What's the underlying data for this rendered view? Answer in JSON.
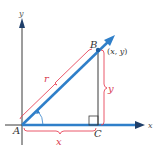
{
  "diagram": {
    "type": "vector-right-triangle",
    "axes": {
      "x_label": "x",
      "y_label": "y"
    },
    "points": {
      "A": {
        "label": "A"
      },
      "B": {
        "label": "B",
        "coords_label": "(x, y)"
      },
      "C": {
        "label": "C"
      }
    },
    "segments": {
      "hypotenuse_label": "r",
      "vertical_label": "y",
      "horizontal_label": "x"
    },
    "colors": {
      "axis": "#3a3a3a",
      "vector": "#2f7fc9",
      "brace": "#e8455a",
      "label_dark": "#333333",
      "label_red": "#d83a50"
    }
  }
}
